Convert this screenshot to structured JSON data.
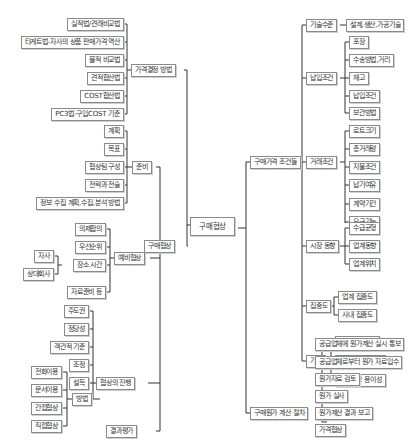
{
  "root": "구매협상",
  "left": {
    "price_method": {
      "label": "가격결정 방법",
      "items": [
        "실적법/견래비교법",
        "타게트법-자사의 상품 판매가격 역산",
        "물적 비교법",
        "견적합산법",
        "COST합산법",
        "PC3법-구입COST 기준"
      ]
    },
    "negotiation": {
      "label": "구매협상",
      "prep": {
        "label": "준비",
        "items": [
          "계획",
          "목표",
          "협상팀 구성",
          "전략과 전술",
          "정보 수집 계획,수집,분석 방법"
        ]
      },
      "pre": {
        "label": "예비협상",
        "items": [
          "의제합의",
          "우선순위",
          "장소 시간",
          "자료준비 등"
        ],
        "place_sub": [
          "자사",
          "상대회사"
        ]
      },
      "progress": {
        "label": "협상의 진행",
        "items": [
          "주도권",
          "정당성",
          "객관적 기준",
          "조정",
          "설득",
          "방법"
        ],
        "method_sub": [
          "전화이용",
          "문서이용",
          "간접협상",
          "직접협상"
        ]
      },
      "result": "결과평가"
    }
  },
  "right": {
    "conditions": {
      "label": "구매가격 조건들",
      "tech": {
        "label": "기술수준",
        "items": [
          "설계,생산,가공기술"
        ]
      },
      "delivery": {
        "label": "납입조건",
        "items": [
          "포장",
          "수송방법,거리",
          "재고",
          "납입조건",
          "보관방법"
        ]
      },
      "trade": {
        "label": "거래조건",
        "items": [
          "로트크기",
          "총거래량",
          "지불조건",
          "납기여유",
          "계약기간",
          "요구기능",
          "품질"
        ]
      },
      "market": {
        "label": "시장 동향",
        "items": [
          "수급균형",
          "업계동향",
          "업계위치"
        ]
      },
      "concentration": {
        "label": "집중도",
        "items": [
          "업계 집중도",
          "사내 집중도"
        ]
      },
      "other": {
        "label": "기타",
        "items": [
          "업계의 성장성",
          "정책적 고려사항",
          "인원확보 용이성"
        ]
      }
    },
    "costing": {
      "label": "구매원가 계산 절차",
      "items": [
        "공급업체에 원가계산 실시 통보",
        "공급업체로부터 원가 자료입수",
        "원가자료 검토",
        "원가 실사",
        "원가계산 결과 보고",
        "가격협상"
      ]
    }
  }
}
